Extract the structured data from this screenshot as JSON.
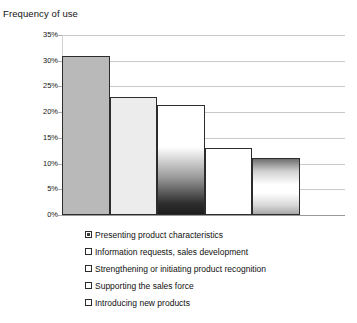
{
  "chart_data": {
    "type": "bar",
    "title": "Frequency of use",
    "xlabel": "",
    "ylabel": "",
    "ylim": [
      0,
      35
    ],
    "ytick_labels": [
      "35%",
      "30%",
      "25%",
      "20%",
      "15%",
      "10%",
      "5%",
      "0%"
    ],
    "ytick_values": [
      35,
      30,
      25,
      20,
      15,
      10,
      5,
      0
    ],
    "grid": true,
    "legend_position": "bottom-left",
    "categories": [
      "Presenting product characteristics",
      "Information requests, sales development",
      "Strengthening or initiating product recognition",
      "Supporting the sales force",
      "Introducing new products"
    ],
    "values": [
      31,
      23,
      21.3,
      13,
      11
    ],
    "series": [
      {
        "name": "Frequency of use",
        "values": [
          31,
          23,
          21.3,
          13,
          11
        ]
      }
    ],
    "bar_fills": [
      "solid-gray",
      "solid-light-gray",
      "gradient-white-to-black",
      "solid-white",
      "gradient-gray-white-gray"
    ]
  },
  "legend": {
    "items": [
      {
        "label": "Presenting product characteristics",
        "swatch": "filled"
      },
      {
        "label": "Information requests, sales development",
        "swatch": "outline"
      },
      {
        "label": "Strengthening or initiating product recognition",
        "swatch": "outline"
      },
      {
        "label": "Supporting the sales force",
        "swatch": "outline"
      },
      {
        "label": "Introducing new products",
        "swatch": "outline"
      }
    ]
  },
  "colors": {
    "bar_border": "#2c2c2c",
    "gridline": "#c9c9c9",
    "baseline": "#9a9a9a",
    "text": "#111111",
    "background": "#ffffff"
  }
}
